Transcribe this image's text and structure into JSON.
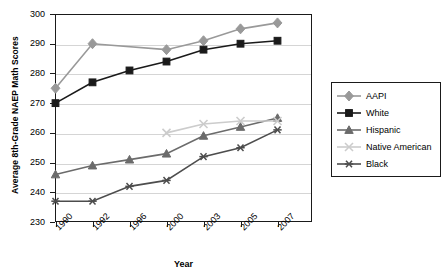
{
  "chart_data": {
    "type": "line",
    "title": "",
    "xlabel": "Year",
    "ylabel": "Average 8th-Grade NAEP Math Scores",
    "categories": [
      "1990",
      "1992",
      "1996",
      "2000",
      "2003",
      "2005",
      "2007"
    ],
    "ylim": [
      230,
      300
    ],
    "yticks": [
      230,
      240,
      250,
      260,
      270,
      280,
      290,
      300
    ],
    "grid": true,
    "legend_position": "right",
    "series": [
      {
        "name": "AAPI",
        "marker": "diamond",
        "color": "#999999",
        "values": [
          275,
          290,
          null,
          288,
          291,
          295,
          297
        ]
      },
      {
        "name": "White",
        "marker": "square",
        "color": "#1a1a1a",
        "values": [
          270,
          277,
          281,
          284,
          288,
          290,
          291
        ]
      },
      {
        "name": "Hispanic",
        "marker": "triangle",
        "color": "#6b6b6b",
        "values": [
          246,
          249,
          251,
          253,
          259,
          262,
          265
        ]
      },
      {
        "name": "Native American",
        "marker": "x",
        "color": "#cccccc",
        "values": [
          null,
          null,
          null,
          260,
          263,
          264,
          264
        ]
      },
      {
        "name": "Black",
        "marker": "asterisk",
        "color": "#4d4d4d",
        "values": [
          237,
          237,
          242,
          244,
          252,
          255,
          261
        ]
      }
    ]
  },
  "legend": {
    "items": [
      {
        "label": "AAPI"
      },
      {
        "label": "White"
      },
      {
        "label": "Hispanic"
      },
      {
        "label": "Native American"
      },
      {
        "label": "Black"
      }
    ]
  },
  "axes": {
    "y_title": "Average 8th-Grade NAEP Math Scores",
    "x_title": "Year",
    "y_tick_labels": [
      "300",
      "290",
      "280",
      "270",
      "260",
      "250",
      "240",
      "230"
    ],
    "x_tick_labels": [
      "1990",
      "1992",
      "1996",
      "2000",
      "2003",
      "2005",
      "2007"
    ]
  }
}
